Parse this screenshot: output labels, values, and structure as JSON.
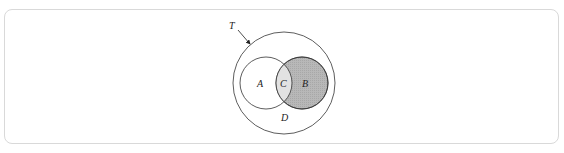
{
  "diagram": {
    "type": "venn",
    "universe": {
      "label": "T",
      "pointer": "arrow-to-outer-circle"
    },
    "sets": [
      {
        "id": "A",
        "label": "A",
        "fill": "#ffffff"
      },
      {
        "id": "B",
        "label": "B",
        "fill": "#b3b3b3"
      }
    ],
    "regions": {
      "intersection": {
        "label": "C",
        "fill": "#e2e2e2"
      },
      "outside": {
        "label": "D"
      }
    },
    "colors": {
      "stroke": "#333333",
      "frame_border": "#d9d9d9",
      "shaded_B": "#b3b3b3",
      "shaded_C": "#e2e2e2"
    }
  }
}
